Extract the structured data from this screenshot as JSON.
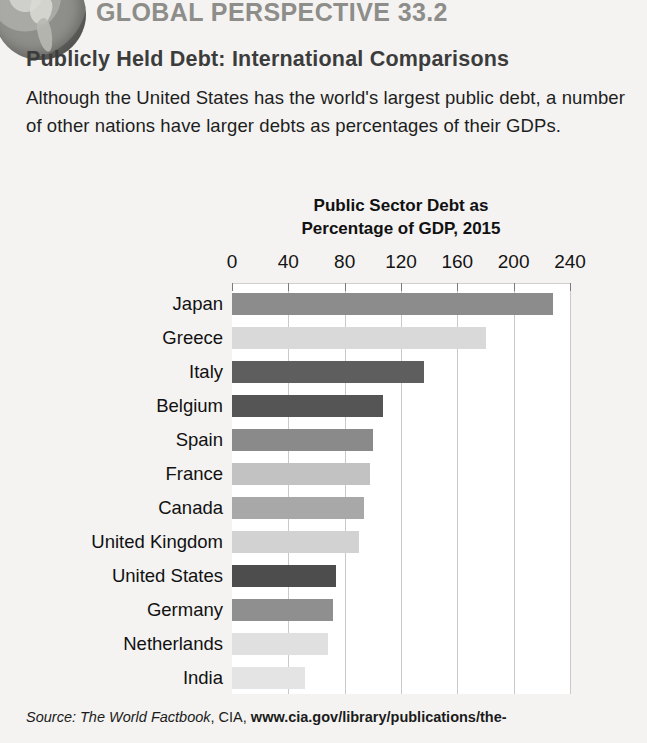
{
  "header": {
    "eyebrow": "GLOBAL PERSPECTIVE 33.2",
    "title": "Publicly Held Debt: International Comparisons",
    "body": "Although the United States has the world's largest public debt, a number of other nations have larger debts as percentages of their GDPs.",
    "globe_icon": "globe-icon"
  },
  "source": {
    "prefix": "Source: ",
    "italic": "The World Factbook",
    "middle": ", CIA, ",
    "bold": "www.cia.gov/library/publications/the-"
  },
  "chart_data": {
    "type": "bar",
    "orientation": "horizontal",
    "title": "Public Sector Debt as Percentage of GDP, 2015",
    "title_line1": "Public Sector Debt as",
    "title_line2": "Percentage of GDP, 2015",
    "xlabel": "",
    "ylabel": "",
    "xlim": [
      0,
      240
    ],
    "xticks": [
      0,
      40,
      80,
      120,
      160,
      200,
      240
    ],
    "xtick_labels": [
      "0",
      "40",
      "80",
      "120",
      "160",
      "200",
      "240"
    ],
    "grid": "vertical",
    "legend": "none",
    "categories": [
      "Japan",
      "Greece",
      "Italy",
      "Belgium",
      "Spain",
      "France",
      "Canada",
      "United Kingdom",
      "United States",
      "Germany",
      "Netherlands",
      "India"
    ],
    "values": [
      228,
      180,
      136,
      107,
      100,
      98,
      94,
      90,
      74,
      72,
      68,
      52
    ],
    "bar_colors": [
      "#8c8c8c",
      "#d9d9d9",
      "#5e5e5e",
      "#555555",
      "#8a8a8a",
      "#c2c2c2",
      "#a8a8a8",
      "#d2d2d2",
      "#4d4d4d",
      "#8f8f8f",
      "#e0e0e0",
      "#e4e4e4"
    ],
    "plot_background": "#ffffff",
    "gridline_color": "#c9c9c9"
  }
}
